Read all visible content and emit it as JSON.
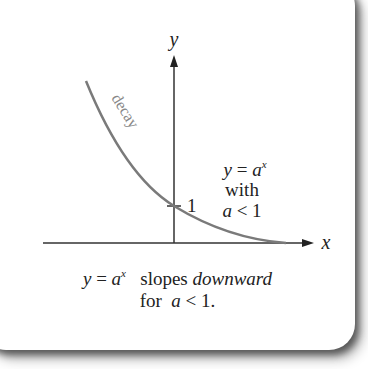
{
  "diagram": {
    "axis_labels": {
      "x": "x",
      "y": "y"
    },
    "curve_label": "decay",
    "tick_label": "1",
    "annotation": {
      "line1_var": "y",
      "line1_eq": " = ",
      "line1_base": "a",
      "line1_exp": "x",
      "line2": "with",
      "line3_var": "a",
      "line3_rest": " < 1"
    },
    "caption": {
      "line1_var": "y",
      "line1_eq": " = ",
      "line1_base": "a",
      "line1_exp": "x",
      "line1_text": "slopes",
      "line1_emph": "downward",
      "line2_text": "for",
      "line2_var": "a",
      "line2_rest": " < 1."
    },
    "colors": {
      "curve": "#7a7a7a",
      "axes": "#333333",
      "text": "#222222",
      "background": "#ffffff"
    }
  }
}
